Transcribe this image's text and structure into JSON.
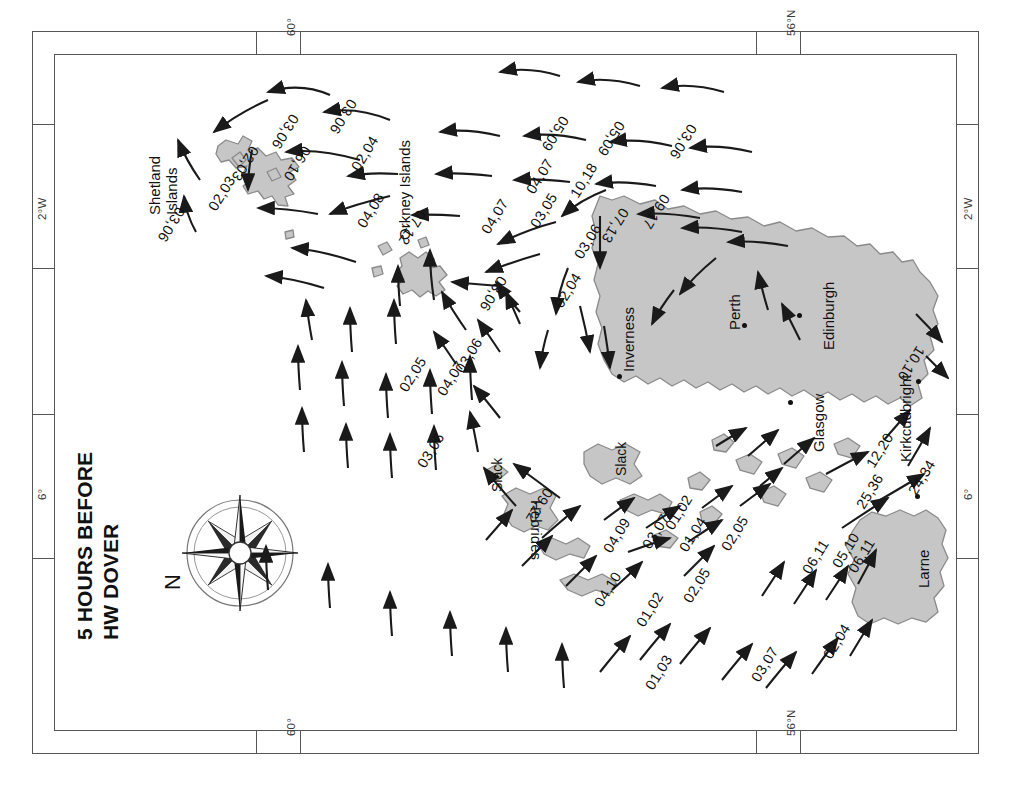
{
  "title": "5 HOURS BEFORE\nHW DOVER",
  "north_label": "N",
  "compass_icon": "compass-rose",
  "border_labels": {
    "left": [
      "2°W",
      "6°"
    ],
    "right": [
      "2°W",
      "6°"
    ],
    "top": [
      "60°",
      "56°N"
    ],
    "bottom": [
      "60°",
      "56°N"
    ]
  },
  "places": [
    {
      "name": "Shetland Islands",
      "label": "Shetland\nIslands",
      "x": 142,
      "y": 148,
      "dot": false
    },
    {
      "name": "Orkney Islands",
      "label": "Orkney Islands",
      "x": 392,
      "y": 123,
      "dot": false
    },
    {
      "name": "Hebrides",
      "label": "Hebrides",
      "x": 533,
      "y": 509,
      "dot": false
    },
    {
      "name": "Inverness",
      "label": "Inverness",
      "x": 616,
      "y": 287,
      "dot": true,
      "dx": 617,
      "dy": 374
    },
    {
      "name": "Perth",
      "label": "Perth",
      "x": 722,
      "y": 283,
      "dot": true,
      "dx": 742,
      "dy": 323
    },
    {
      "name": "Edinburgh",
      "label": "Edinburgh",
      "x": 816,
      "y": 278,
      "dot": true,
      "dx": 797,
      "dy": 313
    },
    {
      "name": "Glasgow",
      "label": "Glasgow",
      "x": 806,
      "y": 381,
      "dot": true,
      "dx": 788,
      "dy": 400
    },
    {
      "name": "Kirkcudbright",
      "label": "Kirkcudbright",
      "x": 893,
      "y": 372,
      "dot": true,
      "dx": 916,
      "dy": 379
    },
    {
      "name": "Larne",
      "label": "Larne",
      "x": 911,
      "y": 531,
      "dot": true,
      "dx": 915,
      "dy": 494
    }
  ],
  "slack_labels": [
    {
      "text": "Slack",
      "x": 489,
      "y": 444
    },
    {
      "text": "Slack",
      "x": 493,
      "y": 463
    }
  ],
  "chart_data": {
    "type": "map",
    "title": "5 HOURS BEFORE HW DOVER",
    "rate_format": "neap,spring (tenths of a knot)",
    "rates": [
      {
        "value": "02,03",
        "x": 205,
        "y": 205,
        "rot": -58
      },
      {
        "value": "03,06",
        "x": 188,
        "y": 213,
        "rot": 122
      },
      {
        "value": "02,03",
        "x": 262,
        "y": 152,
        "rot": 122
      },
      {
        "value": "06,10",
        "x": 314,
        "y": 152,
        "rot": 122
      },
      {
        "value": "03,06",
        "x": 302,
        "y": 120,
        "rot": 122
      },
      {
        "value": "02,04",
        "x": 348,
        "y": 165,
        "rot": -58
      },
      {
        "value": "03,06",
        "x": 360,
        "y": 105,
        "rot": 122
      },
      {
        "value": "04,08",
        "x": 354,
        "y": 222,
        "rot": -58
      },
      {
        "value": "05,09",
        "x": 572,
        "y": 122,
        "rot": 122
      },
      {
        "value": "05,09",
        "x": 628,
        "y": 127,
        "rot": 122
      },
      {
        "value": "03,06",
        "x": 700,
        "y": 130,
        "rot": 122
      },
      {
        "value": "07,12",
        "x": 429,
        "y": 216,
        "rot": 122
      },
      {
        "value": "04,07",
        "x": 478,
        "y": 228,
        "rot": -58
      },
      {
        "value": "04,07",
        "x": 523,
        "y": 188,
        "rot": -58
      },
      {
        "value": "03,05",
        "x": 527,
        "y": 222,
        "rot": -58
      },
      {
        "value": "10,18",
        "x": 567,
        "y": 192,
        "rot": -58
      },
      {
        "value": "03,06",
        "x": 571,
        "y": 253,
        "rot": -58
      },
      {
        "value": "02,04",
        "x": 551,
        "y": 302,
        "rot": -58
      },
      {
        "value": "03,06",
        "x": 510,
        "y": 282,
        "rot": 122
      },
      {
        "value": "07,13",
        "x": 632,
        "y": 214,
        "rot": 122
      },
      {
        "value": "09,17",
        "x": 673,
        "y": 200,
        "rot": 122
      },
      {
        "value": "03,06",
        "x": 452,
        "y": 367,
        "rot": -58
      },
      {
        "value": "04,07",
        "x": 434,
        "y": 390,
        "rot": -58
      },
      {
        "value": "02,05",
        "x": 396,
        "y": 386,
        "rot": -58
      },
      {
        "value": "03,06",
        "x": 414,
        "y": 462,
        "rot": -58
      },
      {
        "value": "09,22",
        "x": 556,
        "y": 494,
        "rot": 122
      },
      {
        "value": "04,09",
        "x": 600,
        "y": 547,
        "rot": -58
      },
      {
        "value": "03,07",
        "x": 639,
        "y": 543,
        "rot": -58
      },
      {
        "value": "01,02",
        "x": 662,
        "y": 524,
        "rot": -58
      },
      {
        "value": "04,10",
        "x": 591,
        "y": 601,
        "rot": -58
      },
      {
        "value": "01,02",
        "x": 633,
        "y": 621,
        "rot": -58
      },
      {
        "value": "02,05",
        "x": 680,
        "y": 597,
        "rot": -58
      },
      {
        "value": "01,04",
        "x": 676,
        "y": 546,
        "rot": -58
      },
      {
        "value": "02,05",
        "x": 718,
        "y": 545,
        "rot": -58
      },
      {
        "value": "01,03",
        "x": 642,
        "y": 684,
        "rot": -58
      },
      {
        "value": "03,07",
        "x": 748,
        "y": 676,
        "rot": -58
      },
      {
        "value": "02,04",
        "x": 820,
        "y": 653,
        "rot": -58
      },
      {
        "value": "06,11",
        "x": 799,
        "y": 568,
        "rot": -58
      },
      {
        "value": "05,10",
        "x": 829,
        "y": 562,
        "rot": -58
      },
      {
        "value": "06,11",
        "x": 845,
        "y": 567,
        "rot": -58
      },
      {
        "value": "25,36",
        "x": 853,
        "y": 503,
        "rot": -58
      },
      {
        "value": "24,34",
        "x": 905,
        "y": 489,
        "rot": -58
      },
      {
        "value": "12,20",
        "x": 863,
        "y": 462,
        "rot": -58
      },
      {
        "value": "10,10",
        "x": 928,
        "y": 352,
        "rot": 122
      }
    ]
  }
}
